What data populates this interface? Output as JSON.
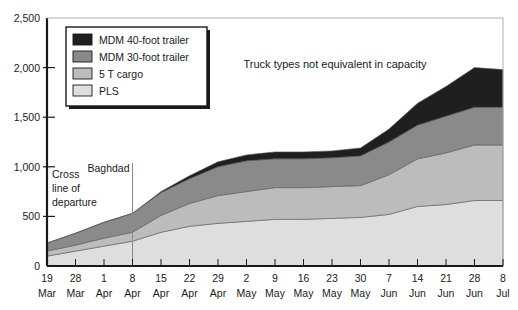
{
  "chart_data": {
    "type": "area",
    "title": "",
    "xlabel": "",
    "ylabel": "",
    "ylim": [
      0,
      2500
    ],
    "yticks": [
      "0",
      "500",
      "1,000",
      "1,500",
      "2,000",
      "2,500"
    ],
    "ytick_values": [
      0,
      500,
      1000,
      1500,
      2000,
      2500
    ],
    "grid": false,
    "legend_position": "upper-left inside plot",
    "stacked": true,
    "categories": [
      "19 Mar",
      "28 Mar",
      "1 Apr",
      "8 Apr",
      "15 Apr",
      "22 Apr",
      "29 Apr",
      "2 May",
      "9 May",
      "16 May",
      "23 May",
      "30 May",
      "7 Jun",
      "14 Jun",
      "21 Jun",
      "28 Jun",
      "8 Jul"
    ],
    "categories_lines": [
      [
        "19",
        "Mar"
      ],
      [
        "28",
        "Mar"
      ],
      [
        "1",
        "Apr"
      ],
      [
        "8",
        "Apr"
      ],
      [
        "15",
        "Apr"
      ],
      [
        "22",
        "Apr"
      ],
      [
        "29",
        "Apr"
      ],
      [
        "2",
        "May"
      ],
      [
        "9",
        "May"
      ],
      [
        "16",
        "May"
      ],
      [
        "23",
        "May"
      ],
      [
        "30",
        "May"
      ],
      [
        "7",
        "Jun"
      ],
      [
        "14",
        "Jun"
      ],
      [
        "21",
        "Jun"
      ],
      [
        "28",
        "Jun"
      ],
      [
        "8",
        "Jul"
      ]
    ],
    "series": [
      {
        "name": "PLS",
        "color": "#dedede",
        "values": [
          100,
          150,
          200,
          250,
          340,
          400,
          430,
          450,
          470,
          470,
          480,
          490,
          520,
          600,
          620,
          660,
          660
        ]
      },
      {
        "name": "5 T cargo",
        "color": "#bcbcbc",
        "values": [
          50,
          60,
          80,
          90,
          170,
          230,
          280,
          300,
          320,
          320,
          320,
          320,
          400,
          480,
          520,
          560,
          560
        ]
      },
      {
        "name": "MDM 30-foot trailer",
        "color": "#8a8a8a",
        "values": [
          80,
          120,
          160,
          190,
          230,
          250,
          290,
          310,
          290,
          290,
          290,
          300,
          330,
          340,
          370,
          380,
          380
        ]
      },
      {
        "name": "MDM 40-foot trailer",
        "color": "#1f1f1f",
        "values": [
          0,
          0,
          0,
          0,
          10,
          30,
          50,
          60,
          70,
          70,
          70,
          80,
          130,
          220,
          300,
          400,
          380
        ]
      }
    ],
    "annotations": [
      {
        "name": "cross-line-of-departure",
        "lines": [
          "Cross",
          "line of",
          "departure"
        ],
        "x_category": "19 Mar"
      },
      {
        "name": "baghdad",
        "lines": [
          "Baghdad"
        ],
        "x_category": "8 Apr"
      }
    ],
    "note": "Truck types not equivalent in capacity",
    "legend": [
      {
        "label": "MDM 40-foot trailer",
        "color": "#1f1f1f"
      },
      {
        "label": "MDM 30-foot trailer",
        "color": "#8a8a8a"
      },
      {
        "label": "5 T cargo",
        "color": "#bcbcbc"
      },
      {
        "label": "PLS",
        "color": "#dedede"
      }
    ]
  }
}
